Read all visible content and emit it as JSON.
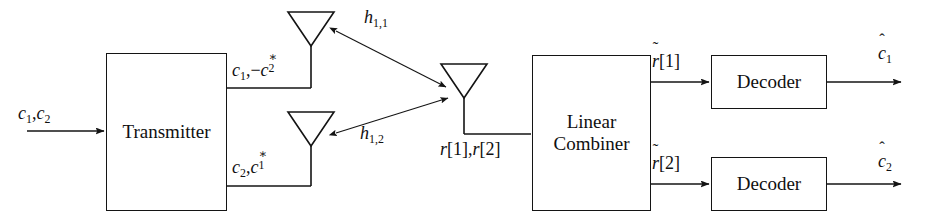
{
  "diagram": {
    "stroke_color": "#141414",
    "background_color": "#ffffff"
  },
  "blocks": {
    "transmitter": {
      "label": "Transmitter"
    },
    "linear_combiner": {
      "label": "Linear\nCombiner"
    },
    "decoder_1": {
      "label": "Decoder"
    },
    "decoder_2": {
      "label": "Decoder"
    }
  },
  "labels": {
    "input_symbols": {
      "base1": "c",
      "sub1": "1",
      "sep": ",",
      "base2": "c",
      "sub2": "2"
    },
    "tx_antenna_1_stream": {
      "text": "c1,-c2*"
    },
    "tx_antenna_2_stream": {
      "text": "c2,c1*"
    },
    "channel_h11": {
      "base": "h",
      "sub": "1,1"
    },
    "channel_h12": {
      "base": "h",
      "sub": "1,2"
    },
    "received_signal": {
      "text": "r[1],r[2]"
    },
    "combined_1": {
      "text": "r~[1]"
    },
    "combined_2": {
      "text": "r~[2]"
    },
    "estimate_1": {
      "base": "c",
      "sub": "1",
      "accent": "hat"
    },
    "estimate_2": {
      "base": "c",
      "sub": "2",
      "accent": "hat"
    }
  },
  "icons": {
    "tx_antenna_1": "antenna-icon",
    "tx_antenna_2": "antenna-icon",
    "rx_antenna": "antenna-icon",
    "channel_link_1": "double-arrow-icon",
    "channel_link_2": "double-arrow-icon",
    "input_arrow": "arrow-right-icon",
    "output_arrow_1": "arrow-right-icon",
    "output_arrow_2": "arrow-right-icon"
  }
}
